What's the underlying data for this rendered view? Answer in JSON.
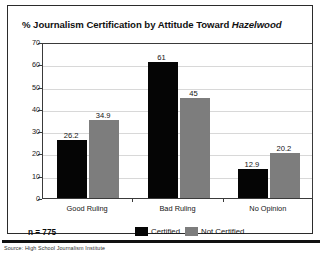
{
  "chart_data": {
    "type": "bar",
    "title": "% Journalism Certification by Attitude Toward Hazelwood",
    "title_plain_prefix": "% Journalism Certification by Attitude Toward ",
    "title_italic_suffix": "Hazelwood",
    "xlabel": "",
    "ylabel": "",
    "ylim": [
      0,
      70
    ],
    "yticks": [
      0,
      10,
      20,
      30,
      40,
      50,
      60,
      70
    ],
    "ytick_labels": [
      "0",
      "10",
      "20",
      "30",
      "40",
      "50",
      "60",
      "70"
    ],
    "grid": true,
    "grid_axis": "y",
    "legend_position": "bottom-center",
    "categories": [
      "Good Ruling",
      "Bad Ruling",
      "No Opinion"
    ],
    "series": [
      {
        "name": "Certified",
        "color": "#050505",
        "values": [
          26.2,
          61,
          12.9
        ],
        "value_labels": [
          "26.2",
          "61",
          "12.9"
        ]
      },
      {
        "name": "Not Certified",
        "color": "#7d7d7d",
        "values": [
          34.9,
          45,
          20.2
        ],
        "value_labels": [
          "34.9",
          "45",
          "20.2"
        ]
      }
    ],
    "annotations": {
      "sample_size": "n = 775"
    }
  },
  "footer": {
    "source": "Source: High School Journalism Institute"
  }
}
